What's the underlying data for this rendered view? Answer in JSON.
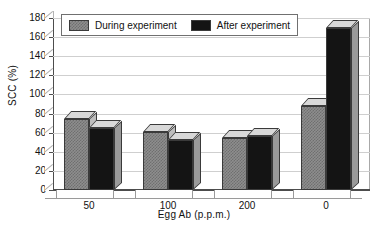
{
  "chart_data": {
    "type": "bar",
    "title": "",
    "xlabel": "Egg Ab (p.p.m.)",
    "ylabel": "SCC (%)",
    "categories": [
      "50",
      "100",
      "200",
      "0"
    ],
    "series": [
      {
        "name": "During experiment",
        "values": [
          74,
          61,
          54,
          88
        ],
        "color": "#8e8e8e"
      },
      {
        "name": "After experiment",
        "values": [
          65,
          52,
          56,
          170
        ],
        "color": "#141414"
      }
    ],
    "ylim": [
      0,
      180
    ],
    "ytick_step": 20,
    "yticks": [
      "180",
      "160",
      "140",
      "120",
      "100",
      "80",
      "60",
      "40",
      "20",
      "0"
    ],
    "grid": true,
    "legend_position": "top-left",
    "style": "3d-clustered-column"
  },
  "legend": {
    "entries": [
      {
        "label": "During experiment"
      },
      {
        "label": "After experiment"
      }
    ]
  },
  "axes": {
    "y_title": "SCC (%)",
    "x_title": "Egg Ab (p.p.m.)"
  }
}
